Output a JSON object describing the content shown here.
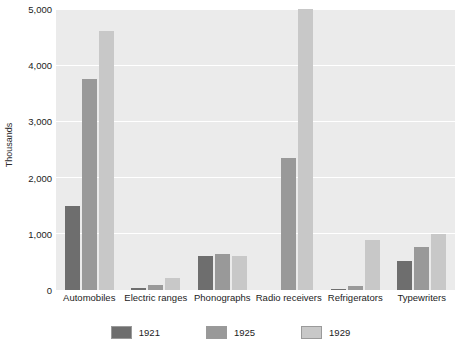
{
  "chart_data": {
    "type": "bar",
    "title": "",
    "subtitle": "",
    "xlabel": "",
    "ylabel": "Thousands",
    "ylim": [
      0,
      5000
    ],
    "ytick_labels": [
      "0",
      "1,000",
      "2,000",
      "3,000",
      "4,000",
      "5,000"
    ],
    "ytick_values": [
      0,
      1000,
      2000,
      3000,
      4000,
      5000
    ],
    "grid": true,
    "grid_axis": "y",
    "legend_position": "bottom",
    "orientation": "vertical",
    "grouping": "grouped",
    "plot_background": "#ebebeb",
    "gridline_color": "#ffffff",
    "categories": [
      "Automobiles",
      "Electric ranges",
      "Phonographs",
      "Radio receivers",
      "Refrigerators",
      "Typewriters"
    ],
    "series": [
      {
        "name": "1921",
        "color": "#6e6e6e",
        "values": [
          1500,
          30,
          600,
          0,
          10,
          520
        ]
      },
      {
        "name": "1925",
        "color": "#999999",
        "values": [
          3750,
          90,
          640,
          2350,
          80,
          760
        ]
      },
      {
        "name": "1929",
        "color": "#c8c8c8",
        "values": [
          4600,
          220,
          600,
          5000,
          890,
          990
        ]
      }
    ]
  }
}
